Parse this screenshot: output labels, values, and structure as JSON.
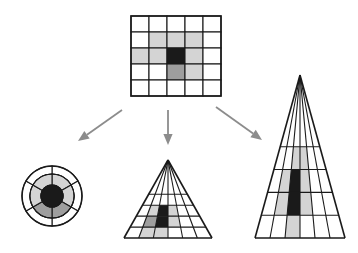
{
  "figure": {
    "background_color": "#ffffff",
    "width": 358,
    "height": 253
  },
  "palette": {
    "line": "#1a1a1a",
    "arrow": "#8c8c8c",
    "cell_empty": "#ffffff",
    "cell_light": "#d4d4d4",
    "cell_medium": "#9e9e9e",
    "cell_dark": "#1a1a1a"
  },
  "shading_legend": [
    {
      "key": "empty",
      "label": "unshaded cell",
      "color": "#ffffff"
    },
    {
      "key": "light",
      "label": "light grey cell",
      "color": "#d4d4d4"
    },
    {
      "key": "medium",
      "label": "medium grey cell",
      "color": "#9e9e9e"
    },
    {
      "key": "dark",
      "label": "dark centre cell",
      "color": "#1a1a1a"
    }
  ],
  "source_grid": {
    "name": "cartesian-grid",
    "rows": 5,
    "cols": 5,
    "x": 131,
    "y": 16,
    "cell_w": 18,
    "cell_h": 16,
    "cells": [
      [
        "empty",
        "empty",
        "empty",
        "empty",
        "empty"
      ],
      [
        "empty",
        "light",
        "light",
        "light",
        "empty"
      ],
      [
        "light",
        "light",
        "dark",
        "light",
        "empty"
      ],
      [
        "empty",
        "empty",
        "medium",
        "light",
        "empty"
      ],
      [
        "empty",
        "empty",
        "empty",
        "empty",
        "empty"
      ]
    ]
  },
  "arrows": [
    {
      "name": "arrow-to-polar",
      "x1": 122,
      "y1": 110,
      "x2": 78,
      "y2": 141
    },
    {
      "name": "arrow-to-cone-wide",
      "x1": 168,
      "y1": 110,
      "x2": 168,
      "y2": 145
    },
    {
      "name": "arrow-to-cone-tall",
      "x1": 216,
      "y1": 107,
      "x2": 262,
      "y2": 140
    }
  ],
  "polar_diagram": {
    "name": "polar-grid",
    "cx": 52,
    "cy": 196,
    "radii": [
      11,
      22,
      30
    ],
    "sector_count": 6,
    "sector_start_deg": -90,
    "rings": [
      {
        "ring": 0,
        "label": "inner disc",
        "fill": "dark"
      },
      {
        "ring": 1,
        "label": "middle ring",
        "sectors": [
          "light",
          "light",
          "medium",
          "medium",
          "light",
          "light"
        ]
      },
      {
        "ring": 2,
        "label": "outer ring",
        "sectors": [
          "empty",
          "empty",
          "empty",
          "empty",
          "empty",
          "empty"
        ]
      }
    ]
  },
  "cone_wide": {
    "name": "cone-wide",
    "apex_x": 168,
    "apex_y": 160,
    "base_y": 238,
    "half_width": 44,
    "cols": 6,
    "rows": 5,
    "cells": [
      [
        "empty",
        "empty",
        "empty",
        "empty",
        "empty",
        "empty"
      ],
      [
        "empty",
        "empty",
        "empty",
        "empty",
        "empty",
        "empty"
      ],
      [
        "empty",
        "light",
        "dark",
        "light",
        "empty",
        "empty"
      ],
      [
        "empty",
        "medium",
        "dark",
        "light",
        "empty",
        "empty"
      ],
      [
        "empty",
        "light",
        "light",
        "empty",
        "empty",
        "empty"
      ]
    ]
  },
  "cone_tall": {
    "name": "cone-tall",
    "apex_x": 300,
    "apex_y": 75,
    "base_y": 238,
    "half_width": 45,
    "cols": 6,
    "rows": 5,
    "cells": [
      [
        "empty",
        "empty",
        "empty",
        "empty",
        "empty",
        "empty"
      ],
      [
        "empty",
        "empty",
        "light",
        "light",
        "empty",
        "empty"
      ],
      [
        "empty",
        "light",
        "dark",
        "light",
        "empty",
        "empty"
      ],
      [
        "empty",
        "light",
        "dark",
        "light",
        "empty",
        "empty"
      ],
      [
        "empty",
        "empty",
        "light",
        "empty",
        "empty",
        "empty"
      ]
    ]
  }
}
